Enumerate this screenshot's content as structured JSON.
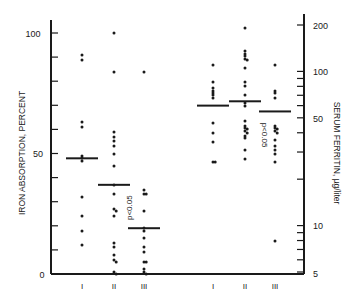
{
  "chart_data": {
    "type": "scatter",
    "title": "",
    "groups": [
      "I",
      "II",
      "III"
    ],
    "left_panel": {
      "ylabel": "IRON ABSORPTION, PERCENT",
      "yscale": "linear",
      "ylim": [
        0,
        100
      ],
      "ytick_labels": [
        "0",
        "50",
        "100"
      ],
      "yticks": [
        0,
        10,
        20,
        30,
        40,
        50,
        60,
        70,
        80,
        90,
        100
      ],
      "xtick_labels": [
        "I",
        "II",
        "III"
      ],
      "annotation": "p<0.05",
      "series": [
        {
          "name": "I",
          "values": [
            91,
            89,
            63,
            61,
            49,
            48,
            47,
            32,
            24,
            18,
            12
          ],
          "median": 48
        },
        {
          "name": "II",
          "values": [
            100,
            84,
            59,
            57,
            55,
            53,
            50,
            45,
            37,
            33,
            27,
            26,
            24,
            13,
            11,
            8,
            6,
            5,
            1,
            0
          ],
          "median": 37
        },
        {
          "name": "III",
          "values": [
            84,
            35,
            33,
            33,
            26,
            19,
            18,
            15,
            11,
            9,
            5,
            5,
            2,
            1,
            0
          ],
          "median": 19
        }
      ]
    },
    "right_panel": {
      "ylabel": "SERUM FERRITIN, µg/liter",
      "yscale": "log",
      "ylim": [
        5,
        200
      ],
      "ytick_labels": [
        "5",
        "10",
        "50",
        "100",
        "200"
      ],
      "yticks": [
        5,
        6,
        7,
        8,
        9,
        10,
        20,
        30,
        40,
        50,
        60,
        70,
        80,
        90,
        100,
        200
      ],
      "xtick_labels": [
        "I",
        "II",
        "III"
      ],
      "annotation": "p<0.05",
      "series": [
        {
          "name": "I",
          "values": [
            110,
            85,
            78,
            75,
            72,
            70,
            67,
            46,
            40,
            35,
            26,
            26
          ],
          "median": 60
        },
        {
          "name": "II",
          "values": [
            190,
            135,
            130,
            125,
            120,
            118,
            105,
            85,
            80,
            70,
            62,
            60,
            48,
            44,
            43,
            42,
            41,
            40,
            38,
            37,
            31,
            27
          ],
          "median": 64
        },
        {
          "name": "III",
          "values": [
            110,
            75,
            72,
            67,
            44,
            43,
            42,
            41,
            40,
            36,
            33,
            31,
            29,
            26,
            8
          ],
          "median": 55
        }
      ]
    }
  },
  "labels": {
    "left_ylabel": "IRON ABSORPTION, PERCENT",
    "right_ylabel": "SERUM FERRITIN, µg/liter",
    "left_y_100": "100",
    "left_y_50": "50",
    "left_y_0": "0",
    "right_y_200": "200",
    "right_y_100": "100",
    "right_y_50": "50",
    "right_y_10": "10",
    "right_y_5": "5",
    "x_I": "I",
    "x_II": "II",
    "x_III": "III",
    "p_left": "p<0.05",
    "p_right": "p<0.05"
  }
}
